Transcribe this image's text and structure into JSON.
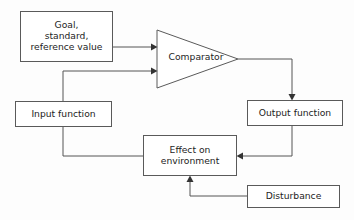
{
  "diagram": {
    "background_color": "#fdfdfd",
    "line_color": "#555555",
    "text_color": "#1d1d1d",
    "nodes": [
      {
        "id": "goal",
        "label": "Goal,\nstandard,\nreference value",
        "shape": "rectangle",
        "x": 20,
        "y": 11,
        "width": 93,
        "height": 51
      },
      {
        "id": "comparator",
        "label": "Comparator",
        "shape": "triangle",
        "x": 157,
        "y": 30,
        "width": 81,
        "height": 58
      },
      {
        "id": "input_function",
        "label": "Input function",
        "shape": "rectangle",
        "x": 15,
        "y": 101,
        "width": 97,
        "height": 26
      },
      {
        "id": "output_function",
        "label": "Output function",
        "shape": "rectangle",
        "x": 247,
        "y": 100,
        "width": 96,
        "height": 26
      },
      {
        "id": "effect_on_environment",
        "label": "Effect on\nenvironment",
        "shape": "rectangle",
        "x": 143,
        "y": 135,
        "width": 94,
        "height": 41
      },
      {
        "id": "disturbance",
        "label": "Disturbance",
        "shape": "rectangle",
        "x": 247,
        "y": 185,
        "width": 93,
        "height": 23
      }
    ],
    "edges": [
      {
        "id": "goal-to-comparator",
        "from": "goal",
        "to": "comparator",
        "arrow": true
      },
      {
        "id": "input-to-comparator",
        "from": "input_function",
        "to": "comparator",
        "arrow": true
      },
      {
        "id": "comparator-to-output",
        "from": "comparator",
        "to": "output_function",
        "arrow": true
      },
      {
        "id": "output-to-effect",
        "from": "output_function",
        "to": "effect_on_environment",
        "arrow": true
      },
      {
        "id": "disturbance-to-effect",
        "from": "disturbance",
        "to": "effect_on_environment",
        "arrow": true
      },
      {
        "id": "input-to-effect",
        "from": "input_function",
        "to": "effect_on_environment",
        "arrow": false
      }
    ]
  }
}
